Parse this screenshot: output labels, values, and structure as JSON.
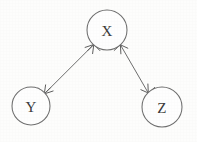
{
  "diagram": {
    "type": "directed-graph",
    "title": "",
    "background_color": "#fdfdfc",
    "stroke_color": "#6e6e6e",
    "label_color": "#3a3a3a",
    "nodes": [
      {
        "id": "X",
        "label": "X",
        "cx": 107,
        "cy": 30,
        "r": 20
      },
      {
        "id": "Y",
        "label": "Y",
        "cx": 31,
        "cy": 106,
        "r": 19
      },
      {
        "id": "Z",
        "label": "Z",
        "cx": 162,
        "cy": 107,
        "r": 20
      }
    ],
    "edges": [
      {
        "id": "edge-x-y",
        "from": "X",
        "to": "Y",
        "direction": "bidirectional",
        "label": "",
        "path": "M 93.8,44.5 L 44.3,93.9",
        "arrow_at_from": "M 99.9,50.6 L 93.8,44.5 L 87.7,50.6 M 93.8,44.5 L 92.6,53.6 M 93.8,44.5 L 85.1,47.4",
        "arrow_at_to": "M 38.2,87.8 L 44.3,93.9 L 50.4,87.8 M 44.3,93.9 L 45.6,84.9 M 44.3,93.9 L 53.1,91.0"
      },
      {
        "id": "edge-x-z",
        "from": "X",
        "to": "Z",
        "direction": "bidirectional",
        "label": "",
        "path": "M 120.4,44.8 L 148.3,93.0",
        "arrow_at_from": "M 114.2,50.4 L 120.4,44.8 L 127.8,48.2 M 120.4,44.8 L 120.9,53.8 M 120.4,44.8 L 112.3,43.0",
        "arrow_at_to": "M 154.6,87.5 L 148.3,93.0 L 140.9,89.7 M 148.3,93.0 L 147.9,84.0 M 148.3,93.0 L 156.4,94.8"
      }
    ]
  }
}
